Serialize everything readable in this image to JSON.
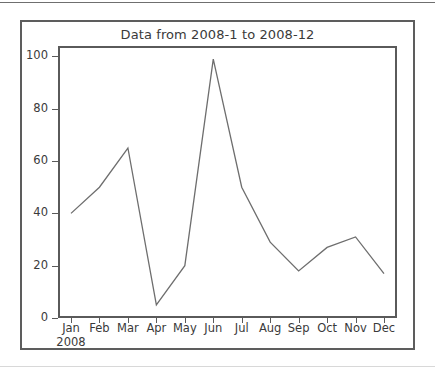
{
  "figure": {
    "title": "Data from 2008-1 to 2008-12",
    "line_color": "#6e6e6e",
    "frame_color": "#5d5d5d",
    "axes_color": "#5a5a5a",
    "text_color": "#3a3a3a",
    "background": "#ffffff"
  },
  "chart_data": {
    "type": "line",
    "title": "Data from 2008-1 to 2008-12",
    "xlabel": "",
    "ylabel": "",
    "categories": [
      "Jan",
      "Feb",
      "Mar",
      "Apr",
      "May",
      "Jun",
      "Jul",
      "Aug",
      "Sep",
      "Oct",
      "Nov",
      "Dec"
    ],
    "x_sublabels": [
      "2008",
      "",
      "",
      "",
      "",
      "",
      "",
      "",
      "",
      "",
      "",
      ""
    ],
    "values": [
      40,
      50,
      65,
      5,
      20,
      99,
      50,
      29,
      18,
      27,
      31,
      17
    ],
    "series": [
      {
        "name": "Data",
        "values": [
          40,
          50,
          65,
          5,
          20,
          99,
          50,
          29,
          18,
          27,
          31,
          17
        ]
      }
    ],
    "ylim": [
      0,
      104
    ],
    "yticks": [
      0,
      20,
      40,
      60,
      80,
      100
    ],
    "ytick_labels": [
      "0",
      "20",
      "40",
      "60",
      "80",
      "100"
    ],
    "xlim": [
      0,
      11
    ],
    "grid": false,
    "legend": null,
    "legend_position": "none",
    "markers": false,
    "line_width": 1.3
  }
}
